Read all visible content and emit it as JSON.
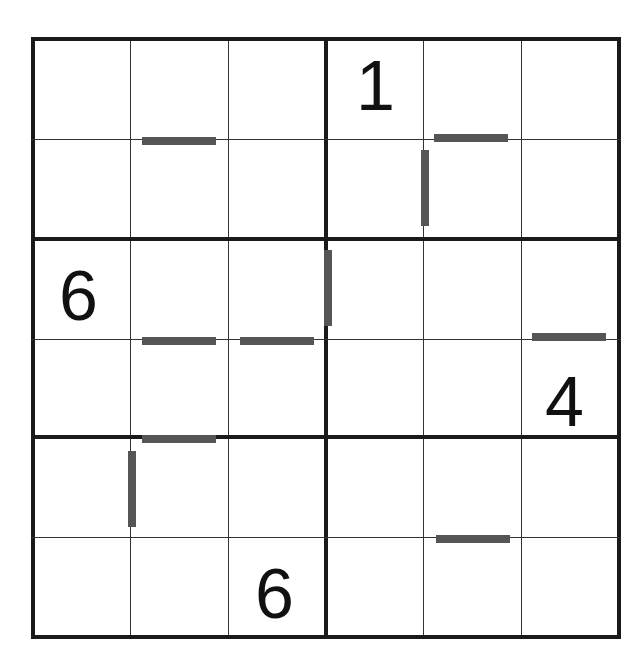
{
  "puzzle": {
    "type": "6x6 sudoku variant with bar clues",
    "rows": 6,
    "cols": 6,
    "box": {
      "rows": 2,
      "cols": 3
    },
    "givens": [
      {
        "row": 0,
        "col": 3,
        "value": "1"
      },
      {
        "row": 2,
        "col": 0,
        "value": "6"
      },
      {
        "row": 3,
        "col": 5,
        "value": "4"
      },
      {
        "row": 5,
        "col": 2,
        "value": "6"
      }
    ],
    "bars": [
      {
        "orientation": "horizontal",
        "between": [
          [
            0,
            1
          ],
          [
            1,
            1
          ]
        ]
      },
      {
        "orientation": "horizontal",
        "between": [
          [
            0,
            4
          ],
          [
            1,
            4
          ]
        ]
      },
      {
        "orientation": "vertical",
        "between": [
          [
            1,
            3
          ],
          [
            1,
            4
          ]
        ]
      },
      {
        "orientation": "vertical",
        "between": [
          [
            2,
            2
          ],
          [
            2,
            3
          ]
        ]
      },
      {
        "orientation": "horizontal",
        "between": [
          [
            2,
            1
          ],
          [
            3,
            1
          ]
        ]
      },
      {
        "orientation": "horizontal",
        "between": [
          [
            2,
            2
          ],
          [
            3,
            2
          ]
        ]
      },
      {
        "orientation": "horizontal",
        "between": [
          [
            2,
            5
          ],
          [
            3,
            5
          ]
        ]
      },
      {
        "orientation": "horizontal",
        "between": [
          [
            3,
            1
          ],
          [
            4,
            1
          ]
        ]
      },
      {
        "orientation": "vertical",
        "between": [
          [
            4,
            0
          ],
          [
            4,
            1
          ]
        ]
      },
      {
        "orientation": "horizontal",
        "between": [
          [
            4,
            4
          ],
          [
            5,
            4
          ]
        ]
      }
    ]
  },
  "colors": {
    "grid": "#1a1a1a",
    "bar": "#555555",
    "digit": "#111111"
  }
}
